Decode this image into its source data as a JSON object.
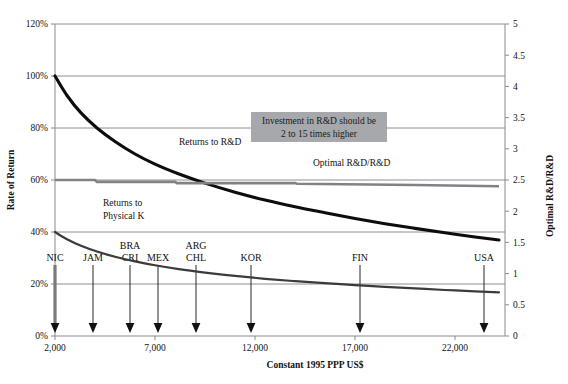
{
  "chart_data": {
    "type": "line",
    "title": "",
    "xlabel": "Constant 1995 PPP US$",
    "ylabel": "Rate of Return",
    "y2label": "Optimal R&D/R&D",
    "xlim": [
      2000,
      24500
    ],
    "ylim": [
      0,
      1.2
    ],
    "y2lim": [
      0,
      5
    ],
    "grid": true,
    "legend_position": "inline-annotations",
    "xticks": [
      2000,
      7000,
      12000,
      17000,
      22000
    ],
    "xticklabels": [
      "2,000",
      "7,000",
      "12,000",
      "17,000",
      "22,000"
    ],
    "yticks": [
      0,
      0.2,
      0.4,
      0.6,
      0.8,
      1.0,
      1.2
    ],
    "yticklabels": [
      "0%",
      "20%",
      "40%",
      "60%",
      "80%",
      "100%",
      "120%"
    ],
    "y2ticks": [
      0,
      0.5,
      1,
      1.5,
      2,
      2.5,
      3,
      3.5,
      4,
      4.5,
      5
    ],
    "y2ticklabels": [
      "0",
      "0.5",
      "1",
      "1.5",
      "2",
      "2.5",
      "3",
      "3.5",
      "4",
      "4.5",
      "5"
    ],
    "series": [
      {
        "name": "Returns to R&D",
        "axis": "left",
        "label_x": 8200,
        "label_y": 0.735,
        "x": [
          2000,
          2600,
          3300,
          4100,
          5000,
          6000,
          7000,
          8200,
          9500,
          11000,
          12500,
          14000,
          15500,
          17000,
          18500,
          20000,
          21500,
          23000,
          24200
        ],
        "values": [
          1.0,
          0.925,
          0.858,
          0.8,
          0.748,
          0.7,
          0.661,
          0.623,
          0.588,
          0.553,
          0.523,
          0.497,
          0.474,
          0.452,
          0.432,
          0.414,
          0.397,
          0.381,
          0.369
        ]
      },
      {
        "name": "Returns to Physical K",
        "axis": "left",
        "label_x": 4400,
        "label_y": 0.5,
        "x": [
          2000,
          2600,
          3300,
          4100,
          5000,
          6000,
          7000,
          8200,
          9500,
          11000,
          12500,
          14000,
          15500,
          17000,
          18500,
          20000,
          21500,
          23000,
          24200
        ],
        "values": [
          0.4,
          0.372,
          0.347,
          0.325,
          0.305,
          0.287,
          0.272,
          0.257,
          0.244,
          0.231,
          0.22,
          0.211,
          0.203,
          0.196,
          0.189,
          0.183,
          0.177,
          0.172,
          0.168
        ]
      },
      {
        "name": "Optimal R&D/R&D",
        "axis": "right",
        "label_x": 14900,
        "label_y": 2.72,
        "x": [
          2000,
          4000,
          4100,
          8000,
          8100,
          14000,
          14100,
          20000,
          24200
        ],
        "values": [
          2.5,
          2.5,
          2.47,
          2.47,
          2.45,
          2.45,
          2.44,
          2.42,
          2.4
        ]
      }
    ],
    "annotations": [
      {
        "name": "investment-callout",
        "lines": [
          "Investment in R&D should be",
          "2 to 15 times higher"
        ],
        "x": 15200,
        "y2": 3.35
      }
    ],
    "country_markers": [
      {
        "code": "NIC",
        "x": 2000,
        "label_lines": [
          "NIC"
        ],
        "stem": "thick"
      },
      {
        "code": "JAM",
        "x": 3900,
        "label_lines": [
          "JAM"
        ],
        "stem": "thin"
      },
      {
        "code": "BRA-CRI",
        "x": 5750,
        "label_lines": [
          "BRA",
          "CRI"
        ],
        "stem": "thin"
      },
      {
        "code": "MEX",
        "x": 7150,
        "label_lines": [
          "MEX"
        ],
        "stem": "thin"
      },
      {
        "code": "ARG-CHL",
        "x": 9050,
        "label_lines": [
          "ARG",
          "CHL"
        ],
        "stem": "thin"
      },
      {
        "code": "KOR",
        "x": 11800,
        "label_lines": [
          "KOR"
        ],
        "stem": "thin"
      },
      {
        "code": "FIN",
        "x": 17250,
        "label_lines": [
          "FIN"
        ],
        "stem": "thin"
      },
      {
        "code": "USA",
        "x": 23450,
        "label_lines": [
          "USA"
        ],
        "stem": "thin"
      }
    ],
    "colors": {
      "returns_rd": "#0d0d0d",
      "returns_physk": "#3b3b3b",
      "optimal": "#808285",
      "callout_bg": "#a6a8ab",
      "grid": "#6f7275",
      "axis": "#888b8d"
    }
  }
}
